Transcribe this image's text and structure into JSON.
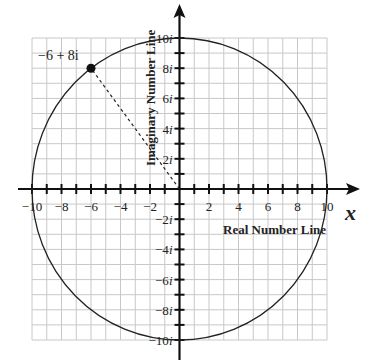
{
  "diagram": {
    "origin_px": [
      179.5,
      189
    ],
    "unit_px": [
      14.75,
      15.1
    ],
    "range": {
      "x": [
        -10,
        10
      ],
      "y": [
        -10,
        10
      ]
    },
    "grid": {
      "step": 1,
      "color": "#c8c8c8"
    },
    "x_axis": {
      "label": "Real Number Line",
      "variable": "x",
      "tick_labels": [
        {
          "value": -10,
          "text": "−10"
        },
        {
          "value": -8,
          "text": "−8"
        },
        {
          "value": -6,
          "text": "−6"
        },
        {
          "value": -4,
          "text": "−4"
        },
        {
          "value": -2,
          "text": "−2"
        },
        {
          "value": 2,
          "text": "2"
        },
        {
          "value": 4,
          "text": "4"
        },
        {
          "value": 6,
          "text": "6"
        },
        {
          "value": 8,
          "text": "8"
        },
        {
          "value": 10,
          "text": "10"
        }
      ]
    },
    "y_axis": {
      "label": "Imaginary Number Line",
      "tick_labels": [
        {
          "value": 10,
          "text": "10i"
        },
        {
          "value": 8,
          "text": "8i"
        },
        {
          "value": 6,
          "text": "6i"
        },
        {
          "value": 4,
          "text": "4i"
        },
        {
          "value": 2,
          "text": "2i"
        },
        {
          "value": -2,
          "text": "−2i"
        },
        {
          "value": -4,
          "text": "−4i"
        },
        {
          "value": -6,
          "text": "−6i"
        },
        {
          "value": -8,
          "text": "−8i"
        },
        {
          "value": -10,
          "text": "−10i"
        }
      ]
    },
    "circle": {
      "center": [
        0,
        0
      ],
      "radius": 10
    },
    "point": {
      "re": -6,
      "im": 8,
      "label": "−6 + 8i"
    },
    "segment": {
      "from": [
        0,
        0
      ],
      "to": [
        -6,
        8
      ],
      "style": "dashed"
    }
  }
}
